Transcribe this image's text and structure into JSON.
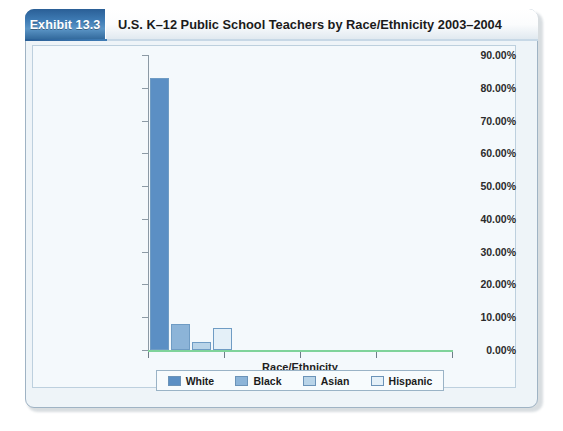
{
  "exhibit": {
    "badge_label": "Exhibit 13.3",
    "title": "U.S. K–12 Public School Teachers by Race/Ethnicity 2003–2004"
  },
  "chart_data": {
    "type": "bar",
    "title": "U.S. K–12 Public School Teachers by Race/Ethnicity 2003–2004",
    "categories": [
      "White",
      "Black",
      "Asian",
      "Hispanic"
    ],
    "values": [
      83.0,
      7.9,
      2.5,
      6.8
    ],
    "value_labels": [
      "83.00%",
      "7.90%",
      "2.50%",
      "6.80%"
    ],
    "series": [
      {
        "name": "Race/Ethnicity",
        "values": [
          83.0,
          7.9,
          2.5,
          6.8
        ]
      }
    ],
    "xlabel": "Race/Ethnicity",
    "ylabel": "",
    "ylim": [
      0,
      90
    ],
    "ytick_labels": [
      "90.00%",
      "80.00%",
      "70.00%",
      "60.00%",
      "50.00%",
      "40.00%",
      "30.00%",
      "20.00%",
      "10.00%",
      "0.00%"
    ],
    "ytick_values": [
      90,
      80,
      70,
      60,
      50,
      40,
      30,
      20,
      10,
      0
    ],
    "xtick_count": 5,
    "grid": false,
    "legend_position": "bottom",
    "legend": [
      {
        "label": "White",
        "color": "#5b8fc4"
      },
      {
        "label": "Black",
        "color": "#8cb4d8"
      },
      {
        "label": "Asian",
        "color": "#b9d4e8"
      },
      {
        "label": "Hispanic",
        "color": "#e4f0f8"
      }
    ],
    "axis_colors": {
      "x_axis": "#7fd39a",
      "y_axis": "#8c9aa5"
    }
  }
}
